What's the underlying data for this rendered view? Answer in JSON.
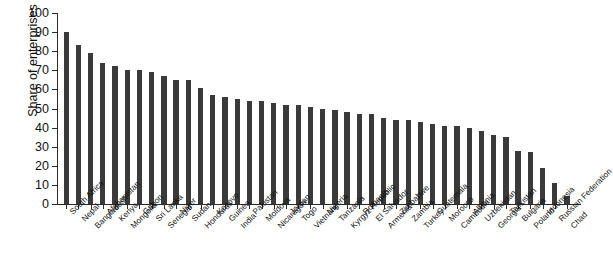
{
  "chart_data": {
    "type": "bar",
    "title": "",
    "xlabel": "",
    "ylabel": "Share of enterprises (%)",
    "ylim": [
      0,
      100
    ],
    "yticks": [
      0,
      10,
      20,
      30,
      40,
      50,
      60,
      70,
      80,
      90,
      100
    ],
    "grid": false,
    "legend": null,
    "bar_color": "#3a3a3a",
    "categories": [
      "South Africa",
      "Nepal",
      "Bangladesh",
      "Afghanistan",
      "Kenya",
      "Mongolia",
      "Gabon",
      "Sri Lanka",
      "Senegal",
      "Niger",
      "Sudan",
      "Honduras",
      "Kosovo",
      "Guinea",
      "India",
      "Pakistan",
      "Moldova",
      "Nicaragua",
      "Jordan",
      "Togo",
      "Vietnam",
      "Nigeria",
      "Tanzania",
      "Kyrgyz Republic",
      "Romania",
      "El Salvador",
      "Armenia",
      "Zimbabwe",
      "Zambia",
      "Turkey",
      "Guatemala",
      "Morocco",
      "Cambodia",
      "Albania",
      "Uzbekistan",
      "Georgia",
      "Tajikistan",
      "Bulgaria",
      "Poland",
      "Indonesia",
      "Russian Federation",
      "Chad"
    ],
    "values": [
      90,
      83,
      79,
      74,
      72,
      70,
      70,
      69,
      67,
      65,
      65,
      61,
      57,
      56,
      55,
      54,
      54,
      53,
      52,
      52,
      51,
      50,
      49,
      48,
      47,
      47,
      45,
      44,
      44,
      43,
      42,
      41,
      41,
      40,
      38,
      36,
      35,
      28,
      27,
      19,
      11,
      4
    ],
    "n_bars": 42
  }
}
